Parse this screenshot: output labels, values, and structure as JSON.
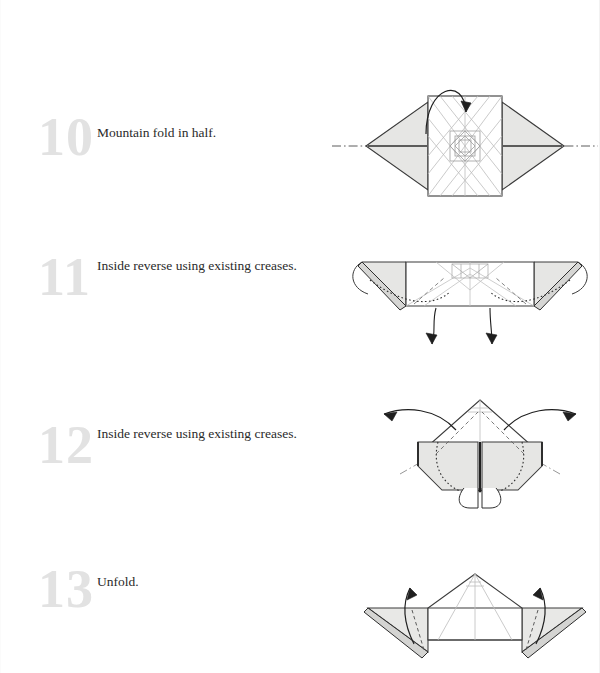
{
  "page": {
    "background_color": "#ffffff",
    "width": 600,
    "height": 673
  },
  "style": {
    "step_number_color": "#e2e2e2",
    "caption_color": "#2a2a2a",
    "paper_front_color": "#e8e8e6",
    "paper_back_color": "#ffffff",
    "outline_color": "#3a3a3a",
    "crease_color": "#b9b9b9",
    "arrow_color": "#1f1f1f",
    "fold_line_color": "#4a4a4a"
  },
  "steps": [
    {
      "number": "10",
      "caption": "Mountain fold in half.",
      "diagram_name": "diagram-step-10",
      "fold_type": "mountain-fold",
      "arrow_count": 1,
      "arrow_style": "loop-over-top"
    },
    {
      "number": "11",
      "caption": "Inside reverse using existing creases.",
      "diagram_name": "diagram-step-11",
      "fold_type": "inside-reverse-fold",
      "arrow_count": 2,
      "arrow_style": "curved-dotted-down"
    },
    {
      "number": "12",
      "caption": "Inside reverse using existing creases.",
      "diagram_name": "diagram-step-12",
      "fold_type": "inside-reverse-fold",
      "arrow_count": 2,
      "arrow_style": "curved-outward-up"
    },
    {
      "number": "13",
      "caption": "Unfold.",
      "diagram_name": "diagram-step-13",
      "fold_type": "unfold",
      "arrow_count": 2,
      "arrow_style": "curved-up"
    }
  ]
}
